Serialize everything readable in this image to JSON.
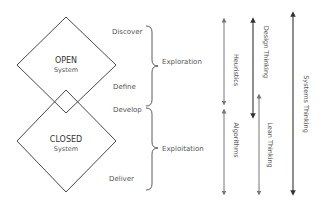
{
  "diagram": {
    "open_system": {
      "title": "OPEN",
      "subtitle": "System"
    },
    "closed_system": {
      "title": "CLOSED",
      "subtitle": "System"
    },
    "phases": {
      "discover": "Discover",
      "define": "Define",
      "develop": "Develop",
      "deliver": "Deliver"
    },
    "groups": {
      "exploration": "Exploration",
      "exploitation": "Exploitation"
    },
    "approaches": {
      "heuristics": "Heuristics",
      "algorithms": "Algorithms",
      "design_thinking": "Design Thinking",
      "lean_thinking": "Lean Thinking",
      "systems_thinking": "Systems Thinking"
    },
    "colors": {
      "line": "#333333",
      "arrow_light": "#777777",
      "arrow_dark": "#333333",
      "text": "#555555"
    }
  }
}
